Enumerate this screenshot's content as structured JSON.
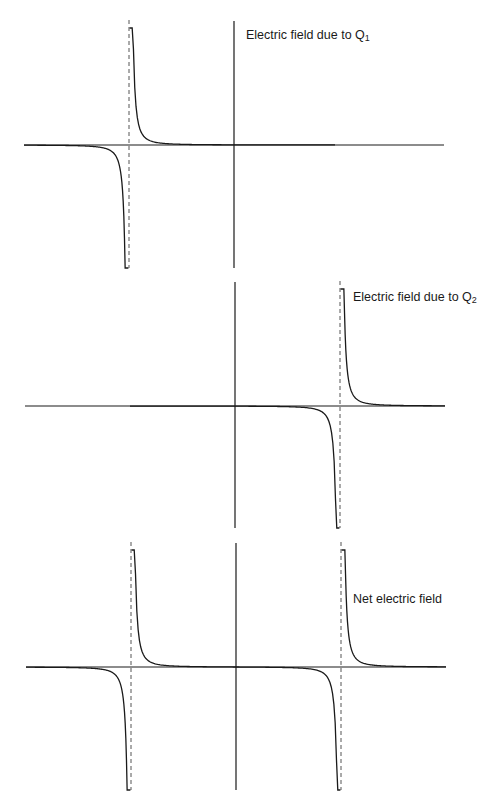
{
  "figure": {
    "colors": {
      "background": "#ffffff",
      "line": "#1a1a1a",
      "asymptote": "#555555"
    },
    "panels": [
      {
        "id": "q1",
        "label_main": "Electric field due to Q",
        "label_sub": "1",
        "label_pos": [
          246,
          28
        ],
        "axis_y": 145,
        "x_start": 24,
        "x_end": 444,
        "y_top": 20,
        "y_bottom": 268,
        "center_x": 234,
        "asymptotes": [
          129
        ],
        "curve_type": "q1"
      },
      {
        "id": "q2",
        "label_main": "Electric field due to Q",
        "label_sub": "2",
        "label_pos": [
          353,
          291
        ],
        "axis_y": 406,
        "x_start": 25,
        "x_end": 445,
        "y_top": 281,
        "y_bottom": 528,
        "center_x": 235,
        "asymptotes": [
          340
        ],
        "curve_type": "q2"
      },
      {
        "id": "net",
        "label_main": "Net electric field",
        "label_sub": "",
        "label_pos": [
          353,
          593
        ],
        "axis_y": 667,
        "x_start": 26,
        "x_end": 446,
        "y_top": 542,
        "y_bottom": 790,
        "center_x": 236,
        "asymptotes": [
          131,
          341
        ],
        "curve_type": "net"
      }
    ]
  }
}
